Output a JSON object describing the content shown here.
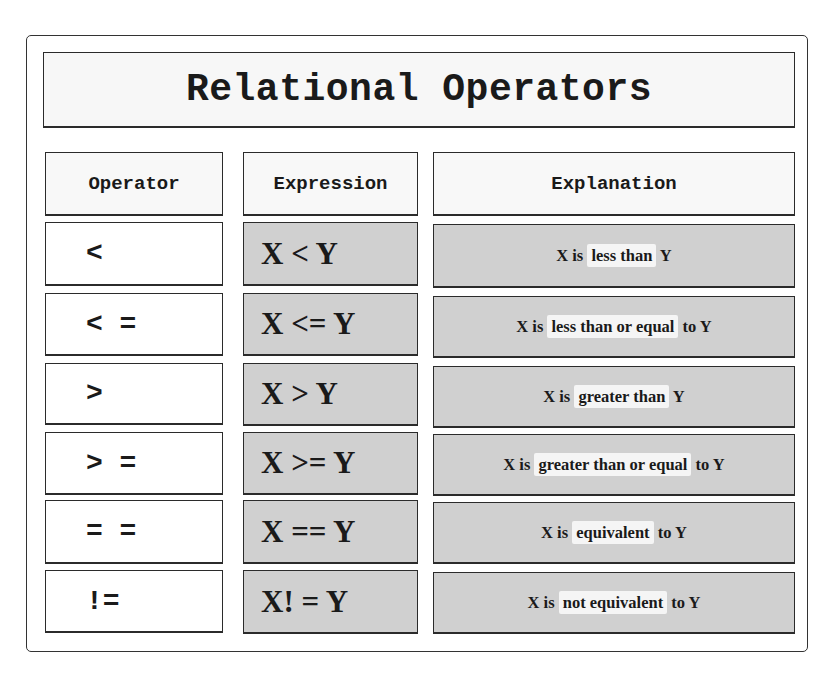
{
  "title": "Relational Operators",
  "headers": {
    "operator": "Operator",
    "expression": "Expression",
    "explanation": "Explanation"
  },
  "rows": [
    {
      "operator": "<",
      "expression": "X < Y",
      "explanation": {
        "pre": "X is ",
        "highlight": "less than",
        "post": " Y"
      }
    },
    {
      "operator": "< =",
      "expression": "X <= Y",
      "explanation": {
        "pre": "X is ",
        "highlight": "less than or equal",
        "post": " to Y"
      }
    },
    {
      "operator": ">",
      "expression": "X > Y",
      "explanation": {
        "pre": "X is ",
        "highlight": "greater than",
        "post": " Y"
      }
    },
    {
      "operator": "> =",
      "expression": "X >= Y",
      "explanation": {
        "pre": "X is ",
        "highlight": "greater than or equal",
        "post": " to Y"
      }
    },
    {
      "operator": "= =",
      "expression": "X == Y",
      "explanation": {
        "pre": "X is ",
        "highlight": "equivalent",
        "post": " to Y"
      }
    },
    {
      "operator": "!=",
      "expression": "X! = Y",
      "explanation": {
        "pre": "X is ",
        "highlight": "not equivalent",
        "post": " to Y"
      }
    }
  ],
  "colors": {
    "filled_cell": "#d0d0d0",
    "header_cell": "#f8f8f8",
    "highlight": "#f5f5f5",
    "border": "#2b2b2b"
  }
}
